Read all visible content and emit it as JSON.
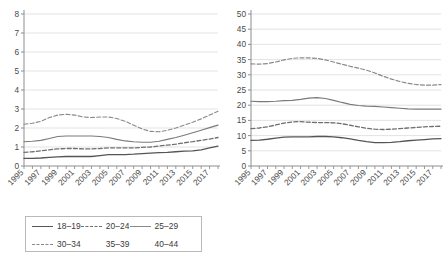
{
  "chart_data": [
    {
      "id": "left",
      "type": "line",
      "title": "",
      "xlabel": "",
      "ylabel": "",
      "xlim": [
        1995,
        2018
      ],
      "ylim": [
        0,
        8
      ],
      "yticks": [
        0,
        1,
        2,
        3,
        4,
        5,
        6,
        7,
        8
      ],
      "xticks": [
        1995,
        1996,
        1997,
        1998,
        1999,
        2000,
        2001,
        2002,
        2003,
        2004,
        2005,
        2006,
        2007,
        2008,
        2009,
        2010,
        2011,
        2012,
        2013,
        2014,
        2015,
        2016,
        2017,
        2018
      ],
      "xtick_labels": [
        "1995",
        "1997",
        "1999",
        "2001",
        "2003",
        "2005",
        "2007",
        "2009",
        "2011",
        "2013",
        "2015",
        "2017"
      ],
      "xtick_labels_years": [
        1995,
        1997,
        1999,
        2001,
        2003,
        2005,
        2007,
        2009,
        2011,
        2013,
        2015,
        2017
      ],
      "grid": true,
      "legend_position": "bottom",
      "x": [
        1995,
        1996,
        1997,
        1998,
        1999,
        2000,
        2001,
        2002,
        2003,
        2004,
        2005,
        2006,
        2007,
        2008,
        2009,
        2010,
        2011,
        2012,
        2013,
        2014,
        2015,
        2016,
        2017,
        2018
      ],
      "series": [
        {
          "name": "18–19",
          "style": "solid",
          "color": "#555555",
          "width": 1.3,
          "values": [
            0.4,
            0.4,
            0.42,
            0.45,
            0.48,
            0.5,
            0.5,
            0.5,
            0.5,
            0.55,
            0.6,
            0.6,
            0.6,
            0.62,
            0.65,
            0.68,
            0.7,
            0.72,
            0.75,
            0.78,
            0.8,
            0.85,
            0.95,
            1.05
          ]
        },
        {
          "name": "20–24",
          "style": "dashed",
          "color": "#6f6f6f",
          "width": 1.3,
          "values": [
            0.72,
            0.75,
            0.8,
            0.85,
            0.9,
            0.92,
            0.92,
            0.9,
            0.9,
            0.92,
            0.95,
            0.95,
            0.95,
            0.95,
            0.98,
            1.0,
            1.05,
            1.1,
            1.15,
            1.22,
            1.28,
            1.35,
            1.42,
            1.5
          ]
        },
        {
          "name": "25–29",
          "style": "solid",
          "color": "#7a7a7a",
          "width": 1.1,
          "values": [
            1.28,
            1.3,
            1.35,
            1.45,
            1.55,
            1.58,
            1.58,
            1.58,
            1.58,
            1.55,
            1.5,
            1.4,
            1.32,
            1.28,
            1.25,
            1.25,
            1.3,
            1.4,
            1.5,
            1.62,
            1.75,
            1.88,
            2.02,
            2.15
          ]
        },
        {
          "name": "30–34",
          "style": "dashed",
          "color": "#8a8a8a",
          "width": 1.1,
          "values": [
            2.2,
            2.25,
            2.35,
            2.55,
            2.68,
            2.72,
            2.68,
            2.58,
            2.55,
            2.58,
            2.58,
            2.5,
            2.35,
            2.15,
            1.95,
            1.82,
            1.8,
            1.88,
            2.0,
            2.15,
            2.3,
            2.48,
            2.68,
            2.88
          ]
        },
        {
          "name": "35–39",
          "style": "none",
          "color": "#c8c8c8",
          "width": 0,
          "values": []
        },
        {
          "name": "40–44",
          "style": "none",
          "color": "#c8c8c8",
          "width": 0,
          "values": []
        }
      ]
    },
    {
      "id": "right",
      "type": "line",
      "title": "",
      "xlabel": "",
      "ylabel": "",
      "xlim": [
        1995,
        2018
      ],
      "ylim": [
        0,
        50
      ],
      "yticks": [
        0,
        5,
        10,
        15,
        20,
        25,
        30,
        35,
        40,
        45,
        50
      ],
      "xticks": [
        1995,
        1996,
        1997,
        1998,
        1999,
        2000,
        2001,
        2002,
        2003,
        2004,
        2005,
        2006,
        2007,
        2008,
        2009,
        2010,
        2011,
        2012,
        2013,
        2014,
        2015,
        2016,
        2017,
        2018
      ],
      "xtick_labels": [
        "1995",
        "1997",
        "1999",
        "2001",
        "2003",
        "2005",
        "2007",
        "2009",
        "2011",
        "2013",
        "2015",
        "2017"
      ],
      "xtick_labels_years": [
        1995,
        1997,
        1999,
        2001,
        2003,
        2005,
        2007,
        2009,
        2011,
        2013,
        2015,
        2017
      ],
      "grid": true,
      "legend_position": "bottom",
      "x": [
        1995,
        1996,
        1997,
        1998,
        1999,
        2000,
        2001,
        2002,
        2003,
        2004,
        2005,
        2006,
        2007,
        2008,
        2009,
        2010,
        2011,
        2012,
        2013,
        2014,
        2015,
        2016,
        2017,
        2018
      ],
      "series": [
        {
          "name": "45–49",
          "style": "solid",
          "color": "#555555",
          "width": 1.3,
          "values": [
            8.4,
            8.5,
            8.8,
            9.2,
            9.5,
            9.6,
            9.6,
            9.6,
            9.7,
            9.7,
            9.6,
            9.3,
            8.9,
            8.4,
            8.0,
            7.7,
            7.7,
            7.8,
            8.0,
            8.3,
            8.5,
            8.7,
            8.9,
            9.0
          ]
        },
        {
          "name": "50–54",
          "style": "dashed",
          "color": "#6f6f6f",
          "width": 1.3,
          "values": [
            12.3,
            12.5,
            12.9,
            13.5,
            14.1,
            14.5,
            14.6,
            14.4,
            14.3,
            14.3,
            14.2,
            13.9,
            13.4,
            12.9,
            12.4,
            12.1,
            12.0,
            12.1,
            12.3,
            12.5,
            12.7,
            12.9,
            13.0,
            13.1
          ]
        },
        {
          "name": "55–59",
          "style": "solid",
          "color": "#7a7a7a",
          "width": 1.2,
          "values": [
            21.3,
            21.2,
            21.2,
            21.3,
            21.5,
            21.6,
            21.9,
            22.3,
            22.5,
            22.2,
            21.6,
            20.9,
            20.3,
            19.9,
            19.7,
            19.6,
            19.4,
            19.2,
            19.0,
            18.8,
            18.7,
            18.7,
            18.7,
            18.7
          ]
        },
        {
          "name": "60–64",
          "style": "dashed",
          "color": "#8a8a8a",
          "width": 1.2,
          "values": [
            33.6,
            33.5,
            33.7,
            34.2,
            34.9,
            35.4,
            35.6,
            35.6,
            35.4,
            34.9,
            34.2,
            33.5,
            32.8,
            32.2,
            31.5,
            30.6,
            29.5,
            28.6,
            27.8,
            27.2,
            26.8,
            26.6,
            26.6,
            26.8
          ]
        },
        {
          "name": "65–67",
          "style": "none",
          "color": "#c8c8c8",
          "width": 0,
          "values": []
        }
      ]
    }
  ],
  "legends": {
    "left": {
      "row1": [
        {
          "label": "18–19",
          "style": "solid",
          "color": "#555555"
        },
        {
          "label": "20–24",
          "style": "dashed",
          "color": "#6f6f6f"
        },
        {
          "label": "25–29",
          "style": "solid",
          "color": "#8a8a8a"
        }
      ],
      "row2": [
        {
          "label": "30–34",
          "style": "dashed",
          "color": "#8a8a8a"
        },
        {
          "label": "35–39",
          "style": "none",
          "color": "#ffffff"
        },
        {
          "label": "40–44",
          "style": "none",
          "color": "#ffffff"
        }
      ]
    },
    "right": {
      "row1": [
        {
          "label": "45–49",
          "style": "solid",
          "color": "#555555"
        },
        {
          "label": "50–54",
          "style": "dashed",
          "color": "#6f6f6f"
        },
        {
          "label": "55–59",
          "style": "solid",
          "color": "#9a9a9a"
        }
      ],
      "row2": [
        {
          "label": "60–64",
          "style": "dashed",
          "color": "#9a9a9a"
        },
        {
          "label": "65–67",
          "style": "none",
          "color": "#ffffff"
        }
      ]
    }
  },
  "colors": {
    "axis": "#8d8d8d",
    "grid": "#d7d7d7",
    "text": "#3a3a3a",
    "legend_border": "#b9b9b9"
  }
}
